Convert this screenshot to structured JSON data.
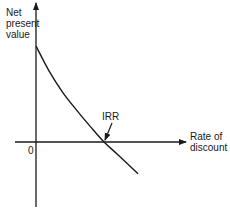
{
  "chart_data": {
    "type": "line",
    "title": "",
    "xlabel": "Rate of discount",
    "ylabel": "Net present value",
    "origin_label": "0",
    "annotations": [
      {
        "text": "IRR",
        "points_to": "x-intercept of NPV curve"
      }
    ],
    "series": [
      {
        "name": "NPV curve",
        "description": "Convex, downward sloping; crosses zero at IRR",
        "x": [
          0,
          0.2,
          0.4,
          0.6,
          0.8,
          1.0,
          1.2,
          1.5
        ],
        "y": [
          1.0,
          0.73,
          0.51,
          0.33,
          0.16,
          0.0,
          -0.13,
          -0.33
        ]
      }
    ],
    "xlim": [
      -0.3,
      2.4
    ],
    "ylim": [
      -0.62,
      1.38
    ],
    "irr_x": 1.0,
    "grid": false,
    "legend": "none",
    "colors": {
      "ink": "#1a1a1a",
      "background": "#ffffff"
    }
  }
}
